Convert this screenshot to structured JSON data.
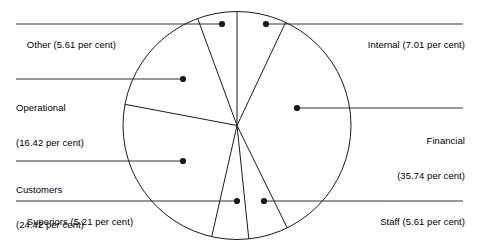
{
  "chart_data": {
    "type": "pie",
    "title": "",
    "subtitle": "",
    "xlabel": "",
    "ylabel": "",
    "legend_position": "callout-labels",
    "grid": false,
    "units": "per cent",
    "start_angle_deg": 0,
    "direction": "clockwise",
    "categories": [
      "Internal",
      "Financial",
      "Staff",
      "Superiors",
      "Customers",
      "Operational",
      "Other"
    ],
    "values": [
      7.01,
      35.74,
      5.61,
      5.21,
      24.42,
      16.42,
      5.61
    ],
    "slices": [
      {
        "name": "Internal",
        "value": 7.01,
        "label": "Internal (7.01 per cent)"
      },
      {
        "name": "Financial",
        "value": 35.74,
        "label": "Financial\n(35.74 per cent)"
      },
      {
        "name": "Staff",
        "value": 5.61,
        "label": "Staff (5.61 per cent)"
      },
      {
        "name": "Superiors",
        "value": 5.21,
        "label": "Superiors (5.21 per cent)"
      },
      {
        "name": "Customers",
        "value": 24.42,
        "label": "Customers\n(24.42 per cent)"
      },
      {
        "name": "Operational",
        "value": 16.42,
        "label": "Operational\n(16.42 per cent)"
      },
      {
        "name": "Other",
        "value": 5.61,
        "label": "Other (5.61 per cent)"
      }
    ],
    "colors": {
      "outline": "#1a1a1a",
      "fill": "#ffffff",
      "leader": "#1a1a1a",
      "text": "#000000"
    }
  },
  "labels": {
    "other": "Other (5.61 per cent)",
    "internal": "Internal (7.01 per cent)",
    "operational_line1": "Operational",
    "operational_line2": "(16.42 per cent)",
    "financial_line1": "Financial",
    "financial_line2": "(35.74 per cent)",
    "customers_line1": "Customers",
    "customers_line2": "(24.42 per cent)",
    "superiors": "Superiors (5.21 per cent)",
    "staff": "Staff (5.61 per cent)"
  }
}
